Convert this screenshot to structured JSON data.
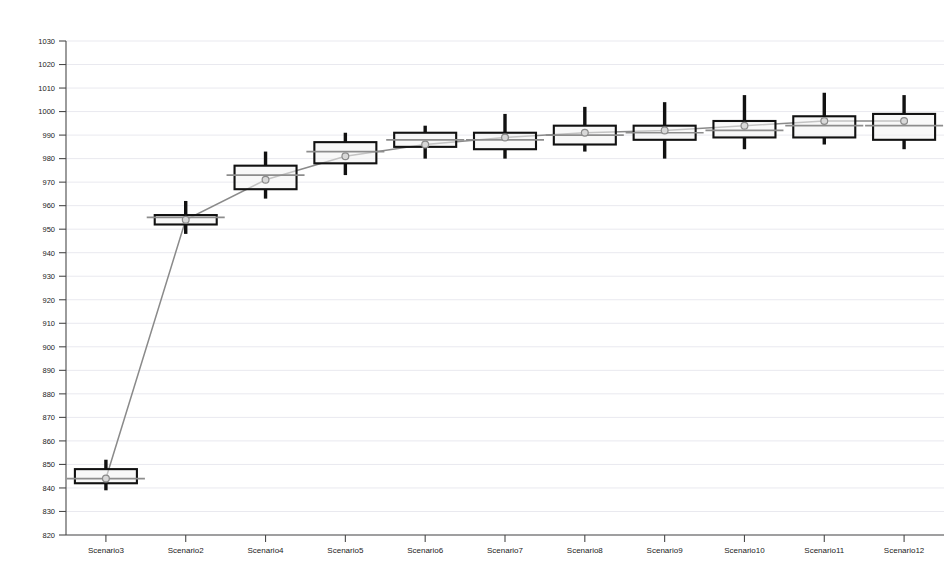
{
  "chart_data": {
    "type": "boxplot",
    "title": "",
    "xlabel": "",
    "ylabel": "",
    "ylim": [
      820,
      1030
    ],
    "ytick_step": 10,
    "grid": true,
    "legend": "none",
    "categories": [
      "Scenario3",
      "Scenario2",
      "Scenario4",
      "Scenario5",
      "Scenario6",
      "Scenario7",
      "Scenario8",
      "Scenario9",
      "Scenario10",
      "Scenario11",
      "Scenario12"
    ],
    "ytick_labels": [
      "1030",
      "1020",
      "1010",
      "1000",
      "990",
      "980",
      "970",
      "960",
      "950",
      "940",
      "930",
      "920",
      "910",
      "900",
      "890",
      "880",
      "870",
      "860",
      "850",
      "840",
      "830",
      "820"
    ],
    "boxes": [
      {
        "category": "Scenario3",
        "whisker_low": 839,
        "q1": 842,
        "median": 844,
        "q3": 848,
        "whisker_high": 852,
        "mean": 844
      },
      {
        "category": "Scenario2",
        "whisker_low": 948,
        "q1": 952,
        "median": 955,
        "q3": 956,
        "whisker_high": 962,
        "mean": 954
      },
      {
        "category": "Scenario4",
        "whisker_low": 963,
        "q1": 967,
        "median": 973,
        "q3": 977,
        "whisker_high": 983,
        "mean": 971
      },
      {
        "category": "Scenario5",
        "whisker_low": 973,
        "q1": 978,
        "median": 983,
        "q3": 987,
        "whisker_high": 991,
        "mean": 981
      },
      {
        "category": "Scenario6",
        "whisker_low": 980,
        "q1": 985,
        "median": 988,
        "q3": 991,
        "whisker_high": 994,
        "mean": 986
      },
      {
        "category": "Scenario7",
        "whisker_low": 980,
        "q1": 984,
        "median": 988,
        "q3": 991,
        "whisker_high": 999,
        "mean": 989
      },
      {
        "category": "Scenario8",
        "whisker_low": 983,
        "q1": 986,
        "median": 990,
        "q3": 994,
        "whisker_high": 1002,
        "mean": 991
      },
      {
        "category": "Scenario9",
        "whisker_low": 980,
        "q1": 988,
        "median": 991,
        "q3": 994,
        "whisker_high": 1004,
        "mean": 992
      },
      {
        "category": "Scenario10",
        "whisker_low": 984,
        "q1": 989,
        "median": 992,
        "q3": 996,
        "whisker_high": 1007,
        "mean": 994
      },
      {
        "category": "Scenario11",
        "whisker_low": 986,
        "q1": 989,
        "median": 994,
        "q3": 998,
        "whisker_high": 1008,
        "mean": 996
      },
      {
        "category": "Scenario12",
        "whisker_low": 984,
        "q1": 988,
        "median": 994,
        "q3": 999,
        "whisker_high": 1007,
        "mean": 996
      }
    ],
    "trend_series": {
      "name": "mean-trend",
      "values": [
        844,
        954,
        971,
        981,
        986,
        989,
        991,
        992,
        994,
        996,
        996
      ]
    },
    "colors": {
      "box_stroke": "#111111",
      "whisker": "#111111",
      "median": "#8d8d8d",
      "trend": "#8a8a8a",
      "grid": "#e9e9ef",
      "axis": "#4a4a4a",
      "text": "#1b1b1b",
      "background": "#ffffff"
    }
  }
}
